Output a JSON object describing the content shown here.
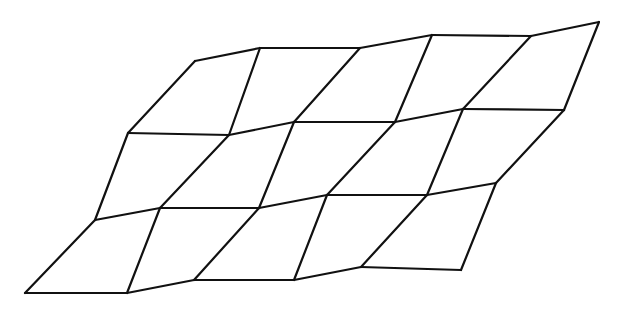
{
  "diagram": {
    "title": "",
    "stroke_color": "#111111",
    "background": "#ffffff",
    "grid": {
      "rows": 4,
      "cols": 6,
      "vertices": [
        [
          [
            195,
            61
          ],
          [
            260,
            48
          ],
          [
            360,
            48
          ],
          [
            432,
            35
          ],
          [
            531,
            36
          ],
          [
            599,
            22
          ]
        ],
        [
          [
            128,
            133
          ],
          [
            229,
            135
          ],
          [
            294,
            122
          ],
          [
            395,
            122
          ],
          [
            463,
            109
          ],
          [
            564,
            110
          ]
        ],
        [
          [
            95,
            220
          ],
          [
            160,
            208
          ],
          [
            259,
            208
          ],
          [
            327,
            195
          ],
          [
            427,
            195
          ],
          [
            496,
            183
          ]
        ],
        [
          [
            25,
            293
          ],
          [
            127,
            293
          ],
          [
            194,
            280
          ],
          [
            294,
            280
          ],
          [
            361,
            267
          ],
          [
            461,
            270
          ]
        ]
      ]
    }
  }
}
